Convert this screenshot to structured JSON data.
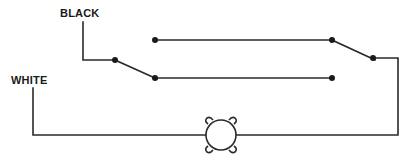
{
  "diagram": {
    "type": "three-way switch wiring",
    "labels": {
      "black": "BLACK",
      "white": "WHITE"
    },
    "components": [
      {
        "id": "switch-1",
        "kind": "SPDT switch",
        "common": [
          115,
          60
        ],
        "throws": [
          [
            155,
            40
          ],
          [
            155,
            78
          ]
        ],
        "arm_to": [
          155,
          78
        ]
      },
      {
        "id": "switch-2",
        "kind": "SPDT switch",
        "common": [
          373,
          58
        ],
        "throws": [
          [
            332,
            40
          ],
          [
            332,
            78
          ]
        ],
        "arm_to": [
          332,
          40
        ]
      },
      {
        "id": "lamp",
        "kind": "light fixture",
        "center": [
          221,
          133
        ],
        "radius": 15
      }
    ],
    "wires": [
      {
        "name": "black-feed",
        "points": [
          [
            83,
            22
          ],
          [
            83,
            60
          ],
          [
            115,
            60
          ]
        ]
      },
      {
        "name": "traveler-top",
        "points": [
          [
            155,
            40
          ],
          [
            332,
            40
          ]
        ]
      },
      {
        "name": "traveler-bottom",
        "points": [
          [
            155,
            78
          ],
          [
            332,
            78
          ]
        ]
      },
      {
        "name": "switch-to-lamp",
        "points": [
          [
            373,
            58
          ],
          [
            398,
            58
          ],
          [
            398,
            135
          ],
          [
            236,
            135
          ]
        ]
      },
      {
        "name": "white-neutral",
        "points": [
          [
            33,
            88
          ],
          [
            33,
            135
          ],
          [
            206,
            135
          ]
        ]
      }
    ],
    "colors": {
      "line": "#2a2a2a",
      "background": "#ffffff"
    }
  }
}
